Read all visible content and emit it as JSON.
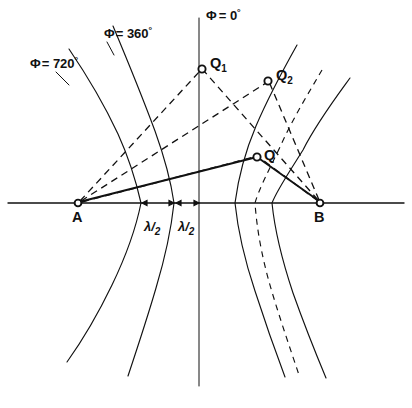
{
  "figure": {
    "background_color": "#ffffff",
    "ink_color": "#111111",
    "width": 412,
    "height": 408
  },
  "axis": {
    "name": "baseline-axis",
    "y": 203,
    "x_start": 8,
    "x_end": 404
  },
  "points": [
    {
      "id": "A",
      "label": "A",
      "x": 78,
      "y": 203,
      "label_x": 74,
      "label_y": 221,
      "marker": "open-circle"
    },
    {
      "id": "B",
      "label": "B",
      "x": 320,
      "y": 203,
      "label_x": 316,
      "label_y": 221,
      "marker": "open-circle"
    },
    {
      "id": "Q1",
      "label": "Q",
      "sub": "1",
      "x": 202,
      "y": 69,
      "label_x": 210,
      "label_y": 66,
      "marker": "open-circle"
    },
    {
      "id": "Q2",
      "label": "Q",
      "sub": "2",
      "x": 268,
      "y": 81,
      "label_x": 276,
      "label_y": 79,
      "marker": "open-circle"
    },
    {
      "id": "Q",
      "label": "Q",
      "sub": "",
      "x": 257,
      "y": 157,
      "label_x": 264,
      "label_y": 157,
      "marker": "open-circle"
    }
  ],
  "phase_labels": [
    {
      "id": "phi720",
      "text": "= 720",
      "symbol": "Φ",
      "degree": "°",
      "x": 30,
      "y": 68,
      "leader_to_x": 69,
      "leader_to_y": 83
    },
    {
      "id": "phi360",
      "text": "= 360",
      "symbol": "Φ",
      "degree": "°",
      "x": 104,
      "y": 38,
      "leader_to_x": 113,
      "leader_to_y": 54
    },
    {
      "id": "phi0",
      "text": "= 0",
      "symbol": "Φ",
      "degree": "°",
      "x": 196,
      "y": 20,
      "leader_to_x": 199,
      "leader_to_y": 29
    }
  ],
  "spacing_labels": [
    {
      "id": "lambda-half-left",
      "numerator": "λ",
      "slash": "/",
      "denominator": "2",
      "x": 146,
      "y": 229,
      "segment_x1": 142,
      "segment_x2": 174
    },
    {
      "id": "lambda-half-right",
      "numerator": "λ",
      "slash": "/",
      "denominator": "2",
      "x": 180,
      "y": 229,
      "segment_x1": 174,
      "segment_x2": 199
    }
  ],
  "contours": [
    {
      "id": "contour-phi720",
      "style": "solid",
      "vertex_x": 141,
      "note": "leftmost solid hyperbola, labelled phi = 720 degrees"
    },
    {
      "id": "contour-phi360",
      "style": "solid",
      "vertex_x": 174,
      "note": "second solid hyperbola, labelled phi = 360 degrees"
    },
    {
      "id": "contour-phi0",
      "style": "solid",
      "vertex_x": 199,
      "note": "vertical perpendicular bisector, labelled phi = 0 degrees"
    },
    {
      "id": "contour-right-1",
      "style": "solid",
      "vertex_x": 235,
      "note": "first solid hyperbola right of centre"
    },
    {
      "id": "contour-dashed",
      "style": "dashed",
      "vertex_x": 255,
      "note": "dashed hyperbola between the two right solid contours"
    },
    {
      "id": "contour-right-2",
      "style": "solid",
      "vertex_x": 272,
      "note": "second solid hyperbola right of centre"
    }
  ],
  "range_lines": [
    {
      "id": "A-Q1",
      "from": "A",
      "to": "Q1",
      "style": "dashed"
    },
    {
      "id": "A-Q2",
      "from": "A",
      "to": "Q2",
      "style": "dashed"
    },
    {
      "id": "A-Q",
      "from": "A",
      "to": "Q",
      "style": "dashed"
    },
    {
      "id": "B-Q1",
      "from": "B",
      "to": "Q1",
      "style": "dashed"
    },
    {
      "id": "B-Q2",
      "from": "B",
      "to": "Q2",
      "style": "dashed"
    },
    {
      "id": "B-Q",
      "from": "B",
      "to": "Q",
      "style": "dashed"
    }
  ],
  "triangle": {
    "id": "triangle-AQB",
    "vertices": [
      "A",
      "Q",
      "B"
    ],
    "style": "solid-heavy"
  }
}
